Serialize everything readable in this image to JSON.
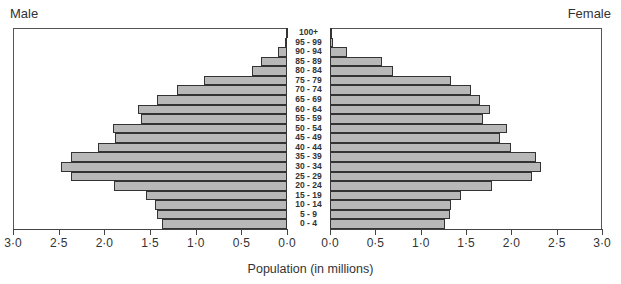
{
  "chart_data": {
    "type": "bar",
    "orientation": "horizontal-pyramid",
    "title": "",
    "xlabel": "Population (in millions)",
    "ylabel": "",
    "left_label": "Male",
    "right_label": "Female",
    "xlim": [
      0,
      3.0
    ],
    "x_ticks": [
      "0·0",
      "0·5",
      "1·0",
      "1·5",
      "2·0",
      "2·5",
      "3·0"
    ],
    "categories": [
      "100+",
      "95 - 99",
      "90 - 94",
      "85 - 89",
      "80 - 84",
      "75 - 79",
      "70 - 74",
      "65 - 69",
      "60 - 64",
      "55 - 59",
      "50 - 54",
      "45 - 49",
      "40 - 44",
      "35 - 39",
      "30 - 34",
      "25 - 29",
      "20 - 24",
      "15 - 19",
      "10 - 14",
      "5 - 9",
      "0 - 4"
    ],
    "series": [
      {
        "name": "Male",
        "values": [
          0.01,
          0.02,
          0.1,
          0.29,
          0.38,
          0.91,
          1.2,
          1.42,
          1.63,
          1.6,
          1.91,
          1.88,
          2.07,
          2.37,
          2.47,
          2.37,
          1.89,
          1.54,
          1.44,
          1.42,
          1.37
        ]
      },
      {
        "name": "Female",
        "values": [
          0.01,
          0.03,
          0.19,
          0.57,
          0.69,
          1.34,
          1.55,
          1.65,
          1.77,
          1.69,
          1.95,
          1.88,
          2.0,
          2.27,
          2.33,
          2.23,
          1.79,
          1.44,
          1.34,
          1.32,
          1.27
        ]
      }
    ],
    "grid": false,
    "legend": "none",
    "colors": {
      "bar_fill": "#b8b8b8",
      "bar_border": "#333333"
    }
  },
  "labels": {
    "male": "Male",
    "female": "Female",
    "xlabel": "Population (in millions)"
  }
}
